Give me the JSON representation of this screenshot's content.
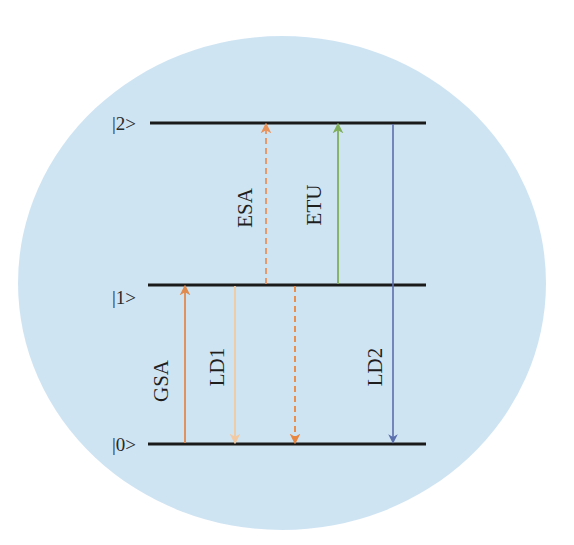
{
  "diagram": {
    "title": "",
    "background": {
      "page": "#ffffff",
      "circle_fill": "#cfe4f3",
      "cx": 282,
      "cy": 283,
      "rx": 264,
      "ry": 247
    },
    "levels": [
      {
        "id": "level-2",
        "label": "|2>",
        "y": 123,
        "x1": 150,
        "x2": 426
      },
      {
        "id": "level-1",
        "label": "|1>",
        "y": 285,
        "x1": 148,
        "x2": 426
      },
      {
        "id": "level-0",
        "label": "|0>",
        "y": 444,
        "x1": 148,
        "x2": 426
      }
    ],
    "level_line_color": "#1a1a1a",
    "transitions": [
      {
        "id": "GSA",
        "label": "GSA",
        "x": 185,
        "from_level": "|0>",
        "to_level": "|1>",
        "direction": "up",
        "style": "solid",
        "color": "#e08a4e",
        "label_x": 163,
        "label_y": 381
      },
      {
        "id": "LD1",
        "label": "LD1",
        "x": 235,
        "from_level": "|1>",
        "to_level": "|0>",
        "direction": "down",
        "style": "solid",
        "color": "#f2c9a0",
        "label_x": 219,
        "label_y": 367
      },
      {
        "id": "ESA",
        "label": "ESA",
        "x": 266,
        "from_level": "|1>",
        "to_level": "|2>",
        "direction": "up",
        "style": "dashed",
        "color": "#e8925a",
        "label_x": 247,
        "label_y": 208
      },
      {
        "id": "NR",
        "label": "",
        "x": 295,
        "from_level": "|1>",
        "to_level": "|0>",
        "direction": "down",
        "style": "dashed",
        "color": "#e8863f",
        "label_x": null,
        "label_y": null
      },
      {
        "id": "ETU",
        "label": "ETU",
        "x": 338,
        "from_level": "|1>",
        "to_level": "|2>",
        "direction": "up",
        "style": "solid",
        "color": "#7fae5a",
        "label_x": 316,
        "label_y": 205
      },
      {
        "id": "LD2",
        "label": "LD2",
        "x": 393,
        "from_level": "|2>",
        "to_level": "|0>",
        "direction": "down",
        "style": "solid",
        "color": "#5a6fae",
        "label_x": 377,
        "label_y": 367
      }
    ]
  }
}
